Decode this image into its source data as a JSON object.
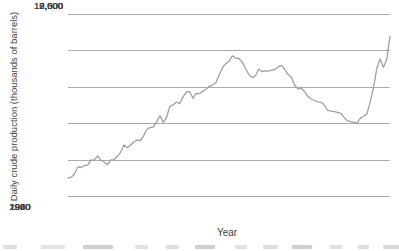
{
  "colors": {
    "line": "#a0a0a0",
    "grid": "#ababab",
    "text": "#454545",
    "background": "#ffffff"
  },
  "chart_data": {
    "type": "line",
    "title": "",
    "xlabel": "Year",
    "ylabel": "Daily crude production (thousands of barrels)",
    "xlim": [
      1920,
      2018
    ],
    "ylim": [
      0,
      12500
    ],
    "grid": "horizontal",
    "legend": "none",
    "line_color": "#a0a0a0",
    "x_ticks": [
      1920,
      1940,
      1960,
      1980,
      2000
    ],
    "x_tick_labels": [
      "1920",
      "1940",
      "1960",
      "1980",
      "2000"
    ],
    "y_ticks": [
      12500,
      10000,
      7500,
      5000,
      2500,
      0
    ],
    "y_tick_labels": [
      "12,500",
      "10,000",
      "7,500",
      "5,000",
      "2,500",
      "0"
    ],
    "x": [
      1920,
      1921,
      1922,
      1923,
      1924,
      1925,
      1926,
      1927,
      1928,
      1929,
      1930,
      1931,
      1932,
      1933,
      1934,
      1935,
      1936,
      1937,
      1938,
      1939,
      1940,
      1941,
      1942,
      1943,
      1944,
      1945,
      1946,
      1947,
      1948,
      1949,
      1950,
      1951,
      1952,
      1953,
      1954,
      1955,
      1956,
      1957,
      1958,
      1959,
      1960,
      1961,
      1962,
      1963,
      1964,
      1965,
      1966,
      1967,
      1968,
      1969,
      1970,
      1971,
      1972,
      1973,
      1974,
      1975,
      1976,
      1977,
      1978,
      1979,
      1980,
      1981,
      1982,
      1983,
      1984,
      1985,
      1986,
      1987,
      1988,
      1989,
      1990,
      1991,
      1992,
      1993,
      1994,
      1995,
      1996,
      1997,
      1998,
      1999,
      2000,
      2001,
      2002,
      2003,
      2004,
      2005,
      2006,
      2007,
      2008,
      2009,
      2010,
      2011,
      2012,
      2013,
      2014,
      2015,
      2016,
      2017,
      2018
    ],
    "series": [
      {
        "name": "Daily crude production (thousands of barrels)",
        "values": [
          1221,
          1294,
          1527,
          2007,
          1955,
          2092,
          2113,
          2477,
          2463,
          2760,
          2460,
          2332,
          2145,
          2481,
          2487,
          2730,
          3001,
          3500,
          3327,
          3466,
          3707,
          3847,
          3799,
          4125,
          4584,
          4695,
          4751,
          5088,
          5520,
          5046,
          5407,
          6158,
          6256,
          6458,
          6342,
          6807,
          7151,
          7170,
          6710,
          7054,
          7035,
          7183,
          7332,
          7542,
          7614,
          7804,
          8295,
          8810,
          9096,
          9238,
          9637,
          9463,
          9441,
          9208,
          8774,
          8375,
          8132,
          8245,
          8707,
          8552,
          8597,
          8572,
          8649,
          8688,
          8879,
          8971,
          8680,
          8349,
          8140,
          7613,
          7355,
          7417,
          7171,
          6847,
          6662,
          6560,
          6465,
          6452,
          6252,
          5881,
          5822,
          5801,
          5746,
          5681,
          5419,
          5178,
          5102,
          5064,
          5000,
          5353,
          5479,
          5653,
          6497,
          7461,
          8789,
          9415,
          8849,
          9357,
          10964
        ]
      }
    ]
  }
}
